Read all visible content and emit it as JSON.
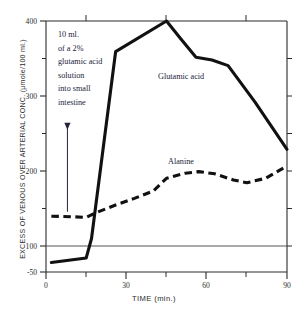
{
  "chart_data": {
    "type": "line",
    "title": "",
    "xlabel": "TIME (min.)",
    "ylabel": "EXCESS OF VENOUS OVER ARTERIAL CONC. (μmole/100 ml.)",
    "xlim": [
      0,
      90
    ],
    "ylim": [
      -50,
      400
    ],
    "xticks": [
      0,
      30,
      60,
      90
    ],
    "xticklabels": [
      "0",
      "30",
      "60",
      "90"
    ],
    "xminorticks": [
      15,
      45,
      75
    ],
    "yticks": [
      -50,
      0,
      100,
      200,
      300,
      400
    ],
    "yticklabels": [
      "-50",
      "0",
      "100",
      "200",
      "300",
      "400"
    ],
    "yminorticks": [
      50,
      150,
      250,
      350
    ],
    "grid": false,
    "zero_line": true,
    "legend_position": "inline-labels",
    "series": [
      {
        "name": "Glutamic acid",
        "style": "solid",
        "color": "#111111",
        "x": [
          2,
          15,
          17,
          26,
          45,
          50,
          56,
          62,
          68,
          78,
          90
        ],
        "y": [
          -33,
          -25,
          10,
          345,
          400,
          370,
          335,
          330,
          320,
          255,
          170
        ]
      },
      {
        "name": "Alanine",
        "style": "dashed",
        "color": "#111111",
        "x": [
          2,
          10,
          15,
          19,
          26,
          33,
          40,
          45,
          52,
          57,
          63,
          70,
          75,
          82,
          90
        ],
        "y": [
          50,
          49,
          48,
          57,
          70,
          82,
          95,
          118,
          127,
          130,
          126,
          115,
          110,
          118,
          140
        ]
      }
    ],
    "annotations": [
      {
        "name": "infusion-note",
        "lines": [
          "10 ml.",
          "of a 2%",
          "glutamic acid",
          "solution",
          "into small",
          "intestine"
        ],
        "arrow": {
          "x": 8,
          "y_from": 205,
          "y_to": 58
        }
      }
    ],
    "series_labels": [
      {
        "name": "Glutamic acid",
        "text": "Glutamic acid"
      },
      {
        "name": "Alanine",
        "text": "Alanine"
      }
    ]
  }
}
